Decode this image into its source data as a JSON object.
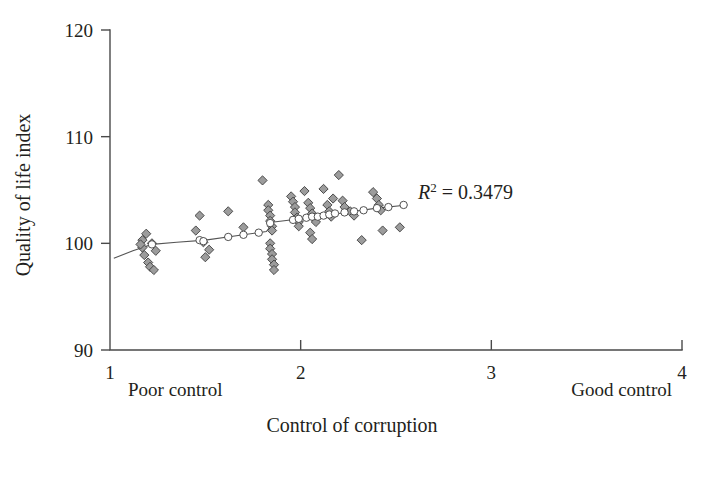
{
  "chart_data": {
    "type": "scatter",
    "title": "",
    "xlabel": "Control of corruption",
    "ylabel": "Quality of life index",
    "xlim": [
      1,
      4
    ],
    "ylim": [
      90,
      120
    ],
    "xticks": [
      1,
      2,
      3,
      4
    ],
    "yticks": [
      90,
      100,
      110,
      120
    ],
    "xtick_labels": [
      "1",
      "2",
      "3",
      "4"
    ],
    "ytick_labels": [
      "90",
      "100",
      "110",
      "120"
    ],
    "grid": false,
    "legend": false,
    "annotations": {
      "r2_symbol": "R",
      "r2_exponent": "2",
      "r2_equals": " = 0.3479",
      "r2_full": "R2 = 0.3479",
      "r2_value": 0.3479,
      "x_range_low_label": "Poor control",
      "x_range_high_label": "Good control"
    },
    "series": [
      {
        "name": "Countries",
        "marker": "diamond",
        "marker_fill": "#9c9c9c",
        "marker_edge": "#3e3e3e",
        "points": [
          [
            1.17,
            100.3
          ],
          [
            1.17,
            99.6
          ],
          [
            1.18,
            98.9
          ],
          [
            1.2,
            98.2
          ],
          [
            1.21,
            97.8
          ],
          [
            1.23,
            97.5
          ],
          [
            1.19,
            100.9
          ],
          [
            1.22,
            100.0
          ],
          [
            1.24,
            99.3
          ],
          [
            1.16,
            99.9
          ],
          [
            1.45,
            101.2
          ],
          [
            1.47,
            102.6
          ],
          [
            1.49,
            100.1
          ],
          [
            1.5,
            98.7
          ],
          [
            1.52,
            99.4
          ],
          [
            1.62,
            103.0
          ],
          [
            1.7,
            101.5
          ],
          [
            1.8,
            105.9
          ],
          [
            1.83,
            103.6
          ],
          [
            1.83,
            103.1
          ],
          [
            1.84,
            102.6
          ],
          [
            1.84,
            102.1
          ],
          [
            1.85,
            101.6
          ],
          [
            1.85,
            101.2
          ],
          [
            1.84,
            100.0
          ],
          [
            1.84,
            99.5
          ],
          [
            1.85,
            99.0
          ],
          [
            1.85,
            98.5
          ],
          [
            1.86,
            98.0
          ],
          [
            1.86,
            97.5
          ],
          [
            1.95,
            104.4
          ],
          [
            1.96,
            103.9
          ],
          [
            1.97,
            103.4
          ],
          [
            1.97,
            102.9
          ],
          [
            1.98,
            102.4
          ],
          [
            1.99,
            102.0
          ],
          [
            1.99,
            101.6
          ],
          [
            2.02,
            104.9
          ],
          [
            2.04,
            103.8
          ],
          [
            2.05,
            103.3
          ],
          [
            2.06,
            102.8
          ],
          [
            2.07,
            102.4
          ],
          [
            2.08,
            102.0
          ],
          [
            2.05,
            101.0
          ],
          [
            2.06,
            100.4
          ],
          [
            2.12,
            105.1
          ],
          [
            2.14,
            103.6
          ],
          [
            2.15,
            103.0
          ],
          [
            2.16,
            102.5
          ],
          [
            2.17,
            104.2
          ],
          [
            2.2,
            106.4
          ],
          [
            2.22,
            104.0
          ],
          [
            2.23,
            103.4
          ],
          [
            2.26,
            103.0
          ],
          [
            2.28,
            102.6
          ],
          [
            2.32,
            100.3
          ],
          [
            2.38,
            104.8
          ],
          [
            2.4,
            104.2
          ],
          [
            2.41,
            103.6
          ],
          [
            2.42,
            103.1
          ],
          [
            2.43,
            101.2
          ],
          [
            2.52,
            101.5
          ]
        ]
      },
      {
        "name": "Fitted values",
        "marker": "circle",
        "marker_fill": "#ffffff",
        "marker_edge": "#3e3e3e",
        "points": [
          [
            1.22,
            99.9
          ],
          [
            1.47,
            100.3
          ],
          [
            1.49,
            100.2
          ],
          [
            1.62,
            100.6
          ],
          [
            1.7,
            100.8
          ],
          [
            1.78,
            101.0
          ],
          [
            1.84,
            101.9
          ],
          [
            1.96,
            102.2
          ],
          [
            1.99,
            102.3
          ],
          [
            2.03,
            102.4
          ],
          [
            2.06,
            102.5
          ],
          [
            2.09,
            102.5
          ],
          [
            2.12,
            102.6
          ],
          [
            2.15,
            102.7
          ],
          [
            2.18,
            102.8
          ],
          [
            2.23,
            102.9
          ],
          [
            2.28,
            103.0
          ],
          [
            2.33,
            103.1
          ],
          [
            2.4,
            103.3
          ],
          [
            2.46,
            103.4
          ],
          [
            2.54,
            103.6
          ]
        ]
      }
    ],
    "trend_line": {
      "description": "fitted regression line, slightly curved",
      "path_points": [
        [
          1.02,
          98.6
        ],
        [
          1.12,
          99.3
        ],
        [
          1.22,
          99.9
        ],
        [
          1.35,
          100.1
        ],
        [
          1.5,
          100.3
        ],
        [
          1.7,
          100.8
        ],
        [
          1.82,
          101.1
        ],
        [
          1.86,
          102.0
        ],
        [
          2.0,
          102.3
        ],
        [
          2.2,
          102.8
        ],
        [
          2.4,
          103.3
        ],
        [
          2.56,
          103.6
        ]
      ]
    }
  }
}
